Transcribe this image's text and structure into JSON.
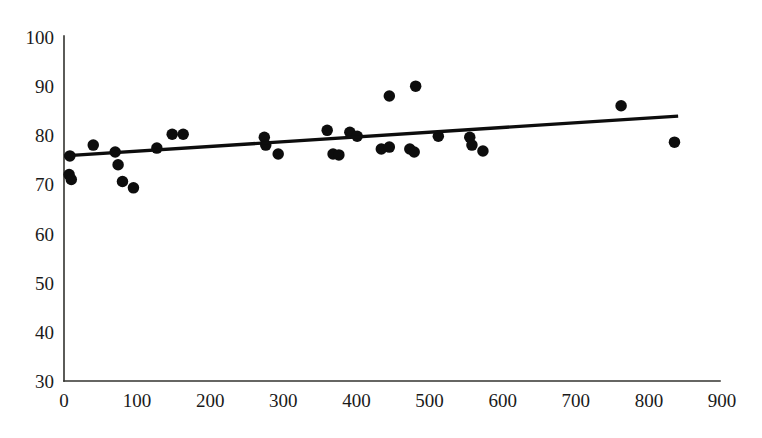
{
  "chart_data": {
    "type": "scatter",
    "title": "",
    "subtitle": "",
    "xlabel": "",
    "ylabel": "",
    "xlim": [
      0,
      900
    ],
    "ylim": [
      30,
      100
    ],
    "grid": false,
    "legend": false,
    "xticks": [
      0,
      100,
      200,
      300,
      400,
      500,
      600,
      700,
      800,
      900
    ],
    "xtick_labels": [
      "0",
      "100",
      "200",
      "300",
      "400",
      "500",
      "600",
      "700",
      "800",
      "900"
    ],
    "yticks": [
      30,
      40,
      50,
      60,
      70,
      80,
      90,
      100
    ],
    "ytick_labels": [
      "30",
      "40",
      "50",
      "60",
      "70",
      "80",
      "90",
      "100"
    ],
    "marker": {
      "shape": "circle",
      "color": "#0d0d0d",
      "diameter_px": 11.5
    },
    "points": [
      {
        "x": 7,
        "y": 72.0
      },
      {
        "x": 10,
        "y": 71.0
      },
      {
        "x": 8,
        "y": 75.8
      },
      {
        "x": 40,
        "y": 78.0
      },
      {
        "x": 70,
        "y": 76.6
      },
      {
        "x": 74,
        "y": 74.0
      },
      {
        "x": 80,
        "y": 70.6
      },
      {
        "x": 95,
        "y": 69.3
      },
      {
        "x": 127,
        "y": 77.4
      },
      {
        "x": 148,
        "y": 80.2
      },
      {
        "x": 163,
        "y": 80.2
      },
      {
        "x": 274,
        "y": 79.6
      },
      {
        "x": 276,
        "y": 78.0
      },
      {
        "x": 293,
        "y": 76.2
      },
      {
        "x": 360,
        "y": 81.0
      },
      {
        "x": 368,
        "y": 76.2
      },
      {
        "x": 376,
        "y": 76.0
      },
      {
        "x": 391,
        "y": 80.6
      },
      {
        "x": 401,
        "y": 79.8
      },
      {
        "x": 445,
        "y": 88.0
      },
      {
        "x": 481,
        "y": 90.0
      },
      {
        "x": 434,
        "y": 77.2
      },
      {
        "x": 445,
        "y": 77.6
      },
      {
        "x": 473,
        "y": 77.2
      },
      {
        "x": 479,
        "y": 76.6
      },
      {
        "x": 512,
        "y": 79.8
      },
      {
        "x": 555,
        "y": 79.6
      },
      {
        "x": 558,
        "y": 78.0
      },
      {
        "x": 573,
        "y": 76.8
      },
      {
        "x": 762,
        "y": 86.0
      },
      {
        "x": 835,
        "y": 78.6
      }
    ],
    "trend_line": {
      "x_start": 0,
      "y_start": 75.8,
      "x_end": 840,
      "y_end": 83.9,
      "color": "#0d0d0d",
      "width_px": 3.4
    }
  },
  "axes": {
    "origin_px": {
      "x": 64,
      "y": 381
    },
    "x_axis_end_px": 720,
    "y_axis_top_px": 36,
    "px_per_x_unit": 0.7311,
    "px_per_y_unit": 4.9143,
    "axis_color": "#33332f"
  }
}
